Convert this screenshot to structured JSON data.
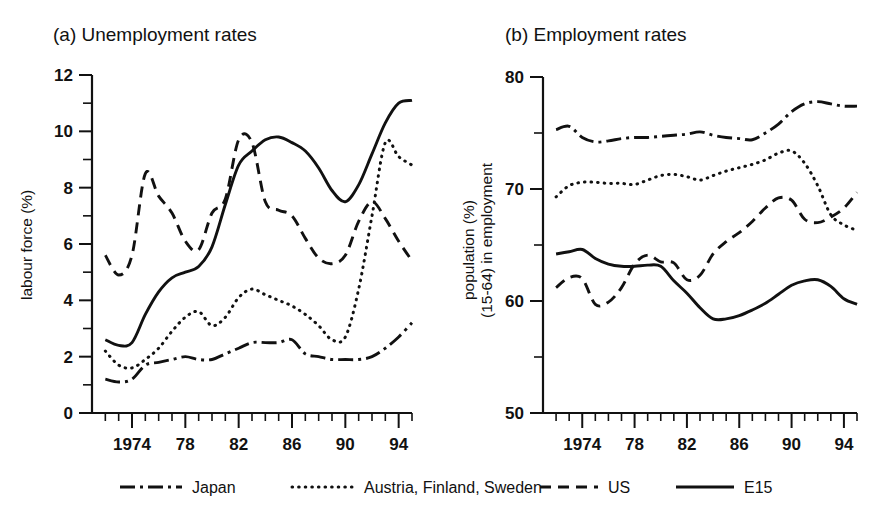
{
  "figure": {
    "background": "#ffffff",
    "ink_color": "#111111"
  },
  "panels": [
    {
      "id": "a",
      "title": "(a) Unemployment rates",
      "ylabel": "labour force (%)"
    },
    {
      "id": "b",
      "title": "(b) Employment rates",
      "ylabel_line1": "population (%)",
      "ylabel_line2": "(15-64) in employment"
    }
  ],
  "legend": {
    "items": [
      {
        "label": "Japan",
        "style": "dashdot"
      },
      {
        "label": "Austria, Finland, Sweden",
        "style": "dotted"
      },
      {
        "label": "US",
        "style": "dashed"
      },
      {
        "label": "E15",
        "style": "solid"
      }
    ]
  },
  "chart_data": [
    {
      "type": "line",
      "title": "(a) Unemployment rates",
      "xlabel": "",
      "ylabel": "labour force (%)",
      "xlim": [
        1971,
        1995
      ],
      "ylim": [
        0,
        12
      ],
      "yticks": [
        0,
        2,
        4,
        6,
        8,
        10,
        12
      ],
      "ytick_labels": [
        "0",
        "2",
        "4",
        "6",
        "8",
        "10",
        "12"
      ],
      "yminor_ticks": [
        1,
        3,
        5,
        7,
        9,
        11
      ],
      "xticks": [
        1974,
        1978,
        1982,
        1986,
        1990,
        1994
      ],
      "xtick_labels": [
        "1974",
        "78",
        "82",
        "86",
        "90",
        "94"
      ],
      "xminor_ticks": [
        1972,
        1973,
        1975,
        1976,
        1977,
        1979,
        1980,
        1981,
        1983,
        1984,
        1985,
        1987,
        1988,
        1989,
        1991,
        1992,
        1993,
        1995
      ],
      "grid": false,
      "legend_position": "below-figure",
      "x": [
        1972,
        1973,
        1974,
        1975,
        1976,
        1977,
        1978,
        1979,
        1980,
        1981,
        1982,
        1983,
        1984,
        1985,
        1986,
        1987,
        1988,
        1989,
        1990,
        1991,
        1992,
        1993,
        1994,
        1995
      ],
      "series": [
        {
          "name": "Japan",
          "style": "dashdot",
          "values": [
            1.2,
            1.1,
            1.2,
            1.7,
            1.8,
            1.9,
            2.0,
            1.9,
            1.9,
            2.1,
            2.3,
            2.5,
            2.5,
            2.5,
            2.6,
            2.1,
            2.0,
            1.9,
            1.9,
            1.9,
            2.0,
            2.3,
            2.7,
            3.2
          ]
        },
        {
          "name": "Austria, Finland, Sweden",
          "style": "dotted",
          "values": [
            2.2,
            1.7,
            1.6,
            1.9,
            2.3,
            2.9,
            3.4,
            3.6,
            3.1,
            3.4,
            4.1,
            4.4,
            4.2,
            4.0,
            3.8,
            3.5,
            3.1,
            2.6,
            2.7,
            4.4,
            7.0,
            9.6,
            9.1,
            8.8
          ]
        },
        {
          "name": "US",
          "style": "dashed",
          "values": [
            5.6,
            4.9,
            5.6,
            8.5,
            7.7,
            7.1,
            6.1,
            5.8,
            7.1,
            7.6,
            9.7,
            9.6,
            7.5,
            7.2,
            7.0,
            6.2,
            5.5,
            5.3,
            5.6,
            6.8,
            7.5,
            6.9,
            6.1,
            5.4
          ]
        },
        {
          "name": "E15",
          "style": "solid",
          "values": [
            2.6,
            2.4,
            2.5,
            3.5,
            4.3,
            4.8,
            5.0,
            5.2,
            5.9,
            7.4,
            8.8,
            9.3,
            9.7,
            9.8,
            9.6,
            9.3,
            8.7,
            7.9,
            7.5,
            8.1,
            9.2,
            10.3,
            11.0,
            11.1
          ]
        }
      ]
    },
    {
      "type": "line",
      "title": "(b) Employment rates",
      "xlabel": "",
      "ylabel": "population (%) (15-64) in employment",
      "xlim": [
        1971,
        1995
      ],
      "ylim": [
        50,
        80
      ],
      "yticks": [
        50,
        60,
        70,
        80
      ],
      "ytick_labels": [
        "50",
        "60",
        "70",
        "80"
      ],
      "yminor_ticks": [
        55,
        65,
        75
      ],
      "xticks": [
        1974,
        1978,
        1982,
        1986,
        1990,
        1994
      ],
      "xtick_labels": [
        "1974",
        "78",
        "82",
        "86",
        "90",
        "94"
      ],
      "xminor_ticks": [
        1972,
        1973,
        1975,
        1976,
        1977,
        1979,
        1980,
        1981,
        1983,
        1984,
        1985,
        1987,
        1988,
        1989,
        1991,
        1992,
        1993,
        1995
      ],
      "grid": false,
      "legend_position": "below-figure",
      "x": [
        1972,
        1973,
        1974,
        1975,
        1976,
        1977,
        1978,
        1979,
        1980,
        1981,
        1982,
        1983,
        1984,
        1985,
        1986,
        1987,
        1988,
        1989,
        1990,
        1991,
        1992,
        1993,
        1994,
        1995
      ],
      "series": [
        {
          "name": "Japan",
          "style": "dashdot",
          "values": [
            75.3,
            75.6,
            74.6,
            74.2,
            74.3,
            74.5,
            74.6,
            74.6,
            74.7,
            74.8,
            74.9,
            75.1,
            74.8,
            74.6,
            74.5,
            74.4,
            75.0,
            75.8,
            76.9,
            77.6,
            77.8,
            77.6,
            77.4,
            77.4
          ]
        },
        {
          "name": "Austria, Finland, Sweden",
          "style": "dotted",
          "values": [
            69.3,
            70.3,
            70.6,
            70.6,
            70.5,
            70.5,
            70.4,
            70.8,
            71.2,
            71.3,
            71.1,
            70.8,
            71.2,
            71.6,
            71.9,
            72.2,
            72.6,
            73.2,
            73.4,
            72.3,
            70.3,
            67.7,
            66.8,
            66.3
          ]
        },
        {
          "name": "US",
          "style": "dashed",
          "values": [
            61.2,
            62.1,
            62.0,
            59.7,
            59.9,
            61.2,
            63.3,
            64.1,
            63.5,
            63.4,
            61.9,
            62.3,
            64.2,
            65.3,
            66.1,
            67.1,
            68.3,
            69.2,
            69.0,
            67.3,
            67.0,
            67.5,
            68.3,
            69.7
          ]
        },
        {
          "name": "E15",
          "style": "solid",
          "values": [
            64.2,
            64.4,
            64.6,
            63.8,
            63.3,
            63.1,
            63.1,
            63.2,
            63.1,
            61.8,
            60.7,
            59.4,
            58.4,
            58.4,
            58.7,
            59.2,
            59.8,
            60.6,
            61.4,
            61.8,
            61.9,
            61.3,
            60.2,
            59.7
          ]
        }
      ]
    }
  ]
}
